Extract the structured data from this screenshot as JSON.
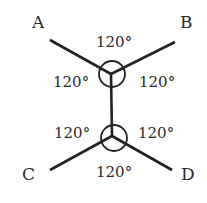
{
  "diagram": {
    "type": "structural",
    "points": {
      "A": "A",
      "B": "B",
      "C": "C",
      "D": "D"
    },
    "angles": {
      "top_upper": "120°",
      "top_left": "120°",
      "top_right": "120°",
      "bottom_left": "120°",
      "bottom_right": "120°",
      "bottom_lower": "120°"
    }
  }
}
